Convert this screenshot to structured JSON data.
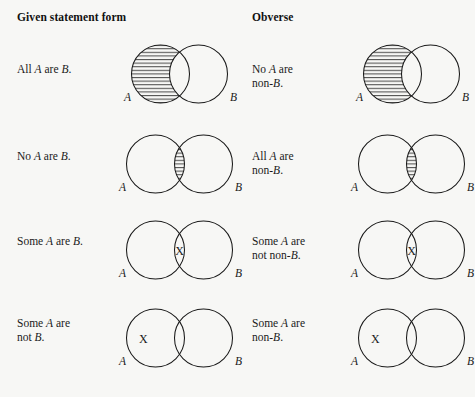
{
  "figure": {
    "title_hidden": "",
    "background_color": "#f7f7f5",
    "stroke_color": "#1a1a1a",
    "hatch_color": "#1a1a1a"
  },
  "headers": {
    "left": "Given statement form",
    "right": "Obverse"
  },
  "labels": {
    "circle_a": "A",
    "circle_b": "B",
    "x_mark": "X"
  },
  "rows": [
    {
      "left": {
        "statement_plain": "All A are B.",
        "statement_html": "All <i>A</i> are <i>B</i>.",
        "shading": "a-only",
        "x_position": "none"
      },
      "right": {
        "statement_plain": "No A are non-B.",
        "statement_html": "No <i>A</i> are\nnon-<i>B</i>.",
        "shading": "a-only",
        "x_position": "none"
      },
      "overlap": "wide"
    },
    {
      "left": {
        "statement_plain": "No A are B.",
        "statement_html": "No <i>A</i> are <i>B</i>.",
        "shading": "intersection",
        "x_position": "none"
      },
      "right": {
        "statement_plain": "All A are non-B.",
        "statement_html": "All <i>A</i> are\nnon-<i>B</i>.",
        "shading": "intersection",
        "x_position": "none"
      },
      "overlap": "narrow"
    },
    {
      "left": {
        "statement_plain": "Some A are B.",
        "statement_html": "Some <i>A</i> are <i>B</i>.",
        "shading": "none",
        "x_position": "intersection"
      },
      "right": {
        "statement_plain": "Some A are not non-B.",
        "statement_html": "Some <i>A</i> are\nnot non-<i>B</i>.",
        "shading": "none",
        "x_position": "intersection"
      },
      "overlap": "narrow"
    },
    {
      "left": {
        "statement_plain": "Some A are not B.",
        "statement_html": "Some <i>A</i> are\nnot <i>B</i>.",
        "shading": "none",
        "x_position": "a-only"
      },
      "right": {
        "statement_plain": "Some A are non-B.",
        "statement_html": "Some <i>A</i> are\nnon-<i>B</i>.",
        "shading": "none",
        "x_position": "a-only"
      },
      "overlap": "narrow"
    }
  ]
}
